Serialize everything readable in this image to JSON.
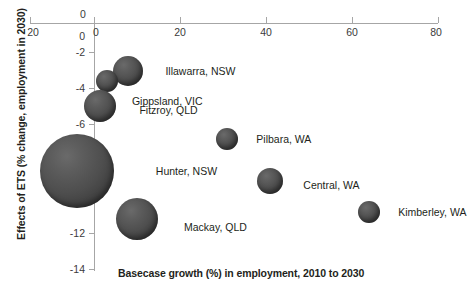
{
  "chart_data": {
    "type": "scatter",
    "title": "",
    "xlabel": "Basecase growth (%) in employment, 2010 to 2030",
    "ylabel": "Effects of ETS (% change, employment in 2030)",
    "xlim": [
      -20,
      80
    ],
    "ylim": [
      -14,
      0
    ],
    "xticks": [
      -20,
      0,
      20,
      40,
      60,
      80
    ],
    "xticklabels": [
      "20",
      "0",
      "20",
      "40",
      "60",
      "80"
    ],
    "yticks": [
      0,
      -2,
      -4,
      -6,
      -8,
      -10,
      -12,
      -14
    ],
    "yticklabels": [
      "0",
      "-2",
      "-4",
      "-6",
      "-8",
      "-10",
      "-12",
      "-14"
    ],
    "x_axis_position": "top",
    "grid": false,
    "legend": "none",
    "bubble_color": "#4e4e4e",
    "axis_color": "#a6a6a6",
    "text_color": "#231f20",
    "points": [
      {
        "label": "Illawarra, NSW",
        "x": 8.0,
        "y": -2.1,
        "size": 15
      },
      {
        "label": "Gippsland, VIC",
        "x": 3.0,
        "y": -2.7,
        "size": 11
      },
      {
        "label": "Fitzroy, QLD",
        "x": 1.5,
        "y": -4.2,
        "size": 16
      },
      {
        "label": "Hunter, NSW",
        "x": -4.0,
        "y": -8.1,
        "size": 37
      },
      {
        "label": "Mackay, QLD",
        "x": 10.0,
        "y": -11.0,
        "size": 21
      },
      {
        "label": "Pilbara, WA",
        "x": 31.0,
        "y": -6.2,
        "size": 11
      },
      {
        "label": "Central, WA",
        "x": 41.0,
        "y": -8.7,
        "size": 13
      },
      {
        "label": "Kimberley, WA",
        "x": 64.0,
        "y": -10.6,
        "size": 11
      }
    ]
  },
  "axes": {
    "y_title": "Effects of ETS (% change, employment in 2030)",
    "x_title": "Basecase growth (%) in employment, 2010 to 2030",
    "origin_zero_label": "0"
  },
  "labels": {
    "illawarra": "Illawarra, NSW",
    "gippsland": "Gippsland, VIC",
    "fitzroy": "Fitzroy, QLD",
    "hunter": "Hunter, NSW",
    "mackay": "Mackay, QLD",
    "pilbara": "Pilbara, WA",
    "central": "Central, WA",
    "kimberley": "Kimberley, WA"
  },
  "xtick_labels": {
    "t0": "20",
    "t1": "0",
    "t2": "20",
    "t3": "40",
    "t4": "60",
    "t5": "80"
  },
  "ytick_labels": {
    "t0": "0",
    "t1": "-2",
    "t2": "-4",
    "t3": "-6",
    "t4": "-8",
    "t5": "-10",
    "t6": "-12",
    "t7": "-14"
  }
}
